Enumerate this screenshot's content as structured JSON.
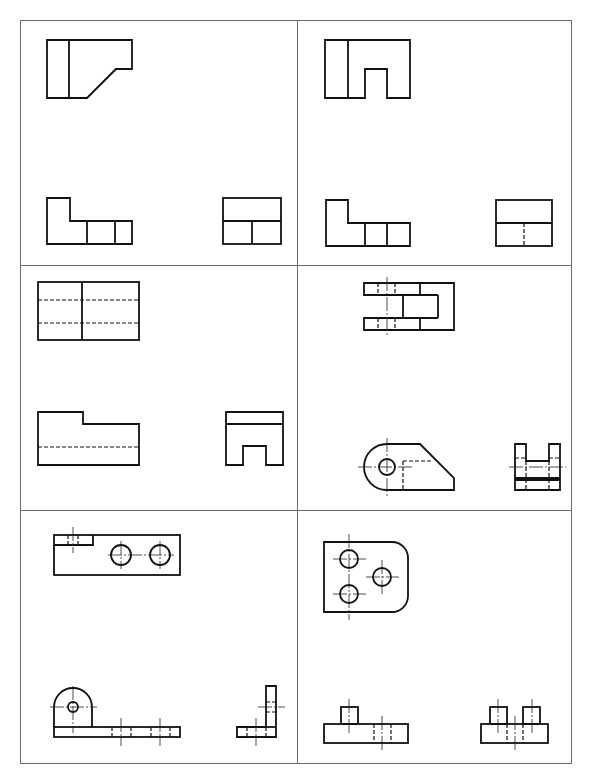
{
  "sheet": {
    "title": "Orthographic three-view exercises",
    "layout": {
      "rows": 3,
      "columns": 2
    },
    "line_colors": {
      "visible": "#111111",
      "frame": "#6a6a6a"
    }
  },
  "cells": [
    {
      "id": "cell-1",
      "views": [
        "front-view",
        "top-view",
        "side-view"
      ],
      "features": [
        "chamfer"
      ]
    },
    {
      "id": "cell-2",
      "views": [
        "front-view",
        "top-view",
        "side-view"
      ],
      "features": [
        "rectangular-notch",
        "hidden-line"
      ]
    },
    {
      "id": "cell-3",
      "views": [
        "front-view",
        "top-view",
        "side-view"
      ],
      "features": [
        "hidden-lines",
        "step",
        "notch"
      ]
    },
    {
      "id": "cell-4",
      "views": [
        "top-view",
        "front-view",
        "side-view"
      ],
      "features": [
        "fork",
        "hole",
        "rounded-end",
        "chamfer"
      ]
    },
    {
      "id": "cell-5",
      "views": [
        "top-view",
        "front-view",
        "side-view"
      ],
      "features": [
        "holes",
        "angle-bracket",
        "rounded-lug"
      ]
    },
    {
      "id": "cell-6",
      "views": [
        "top-view",
        "front-view",
        "side-view"
      ],
      "features": [
        "three-holes",
        "rounded-corner",
        "bosses"
      ]
    }
  ]
}
